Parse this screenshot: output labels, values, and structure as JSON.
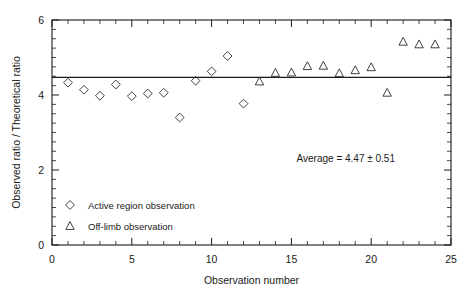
{
  "chart_data": {
    "type": "scatter",
    "title": "",
    "xlabel": "Observation number",
    "ylabel": "Observed ratio / Theoretical ratio",
    "xlim": [
      0,
      25
    ],
    "ylim": [
      0,
      6
    ],
    "xticks": [
      0,
      5,
      10,
      15,
      20,
      25
    ],
    "yticks": [
      0,
      2,
      4,
      6
    ],
    "xtick_labels": [
      "0",
      "5",
      "10",
      "15",
      "20",
      "25"
    ],
    "ytick_labels": [
      "0",
      "2",
      "4",
      "6"
    ],
    "x_minor_step": 1,
    "y_minor_step": 0.25,
    "grid": false,
    "legend_position": "lower-left-inside",
    "series": [
      {
        "name": "Active region observation",
        "marker": "diamond",
        "x": [
          1,
          2,
          3,
          4,
          5,
          6,
          7,
          8,
          9,
          10,
          11,
          12
        ],
        "values": [
          4.33,
          4.14,
          3.98,
          4.28,
          3.97,
          4.04,
          4.06,
          3.4,
          4.38,
          4.63,
          5.04,
          3.77
        ]
      },
      {
        "name": "Off-limb observation",
        "marker": "triangle",
        "x": [
          13,
          14,
          15,
          16,
          17,
          18,
          19,
          20,
          21,
          22,
          23,
          24
        ],
        "values": [
          4.36,
          4.59,
          4.6,
          4.77,
          4.78,
          4.58,
          4.66,
          4.74,
          4.06,
          5.42,
          5.35,
          5.35
        ]
      }
    ],
    "reference_line": {
      "name": "average",
      "orientation": "horizontal",
      "y": 4.47
    },
    "annotation": "Average  =  4.47 ± 0.51",
    "legend": [
      {
        "marker": "diamond",
        "label": "Active region observation"
      },
      {
        "marker": "triangle",
        "label": "Off-limb observation"
      }
    ]
  }
}
